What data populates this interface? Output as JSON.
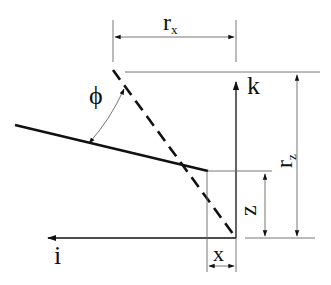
{
  "diagram": {
    "labels": {
      "rx_main": "r",
      "rx_sub": "x",
      "rz_main": "r",
      "rz_sub": "z",
      "phi": "ϕ",
      "k_axis": "k",
      "i_axis": "i",
      "z_dim": "z",
      "x_dim": "x"
    },
    "colors": {
      "line": "#111111",
      "dimension_line": "#666666",
      "background": "#ffffff"
    },
    "elements": [
      {
        "type": "solid-line",
        "description": "inclined solid segment"
      },
      {
        "type": "dashed-line",
        "description": "inclined dashed segment"
      },
      {
        "type": "axis",
        "name": "k",
        "direction": "up"
      },
      {
        "type": "axis",
        "name": "i",
        "direction": "left"
      },
      {
        "type": "dimension",
        "name": "r_x",
        "orientation": "horizontal"
      },
      {
        "type": "dimension",
        "name": "r_z",
        "orientation": "vertical"
      },
      {
        "type": "dimension",
        "name": "z",
        "orientation": "vertical"
      },
      {
        "type": "dimension",
        "name": "x",
        "orientation": "horizontal"
      },
      {
        "type": "angle",
        "name": "phi",
        "between": [
          "solid-line",
          "dashed-line"
        ]
      }
    ]
  }
}
